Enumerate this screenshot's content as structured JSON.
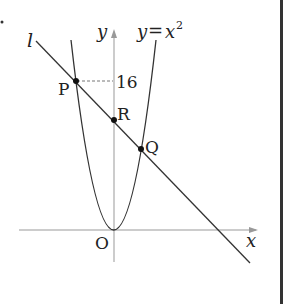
{
  "figure": {
    "curve_label": "y=x²",
    "curve_label_lhs": "y",
    "curve_label_eq": "=",
    "curve_label_rhs": "x",
    "curve_label_exp": "2",
    "line_label": "l",
    "y_axis_label": "y",
    "x_axis_label": "x",
    "origin_label": "O",
    "y_tick_label": "16",
    "points": {
      "P": "P",
      "R": "R",
      "Q": "Q"
    }
  },
  "colors": {
    "stroke": "#333333",
    "axis": "#999999",
    "divider": "#333333"
  }
}
